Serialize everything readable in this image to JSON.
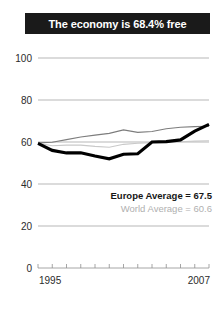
{
  "title": "The economy is 68.4% free",
  "chart_data": {
    "type": "line",
    "title": "The economy is 68.4% free",
    "xlabel": "",
    "ylabel": "",
    "xlim": [
      1995,
      2007
    ],
    "ylim": [
      0,
      100
    ],
    "yticks": [
      0,
      20,
      40,
      60,
      80,
      100
    ],
    "xticks": [
      1995,
      1996,
      1997,
      1998,
      1999,
      2000,
      2001,
      2002,
      2003,
      2004,
      2005,
      2006,
      2007
    ],
    "xtick_labels_shown": [
      "1995",
      "2007"
    ],
    "grid": true,
    "legend_position": "inside-right",
    "x": [
      1995,
      1996,
      1997,
      1998,
      1999,
      2000,
      2001,
      2002,
      2003,
      2004,
      2005,
      2006,
      2007
    ],
    "series": [
      {
        "name": "Country",
        "color": "#000000",
        "width": "thick",
        "values": [
          59.3,
          56.0,
          54.8,
          54.9,
          53.3,
          52.0,
          54.2,
          54.4,
          60.0,
          60.2,
          61.0,
          65.2,
          68.4
        ]
      },
      {
        "name": "Europe Average",
        "color": "#7d7d7d",
        "width": "thin",
        "values": [
          59.6,
          59.9,
          61.1,
          62.4,
          63.3,
          64.1,
          65.8,
          64.6,
          65.0,
          66.3,
          67.0,
          67.3,
          67.5
        ]
      },
      {
        "name": "World Average",
        "color": "#c9c9c9",
        "width": "thin",
        "values": [
          59.4,
          58.2,
          58.5,
          58.5,
          57.9,
          57.5,
          58.9,
          59.4,
          59.7,
          59.9,
          60.1,
          60.4,
          60.6
        ]
      }
    ],
    "annotations": [
      {
        "label": "Europe Average = 67.5",
        "value": 67.5,
        "series": "Europe Average"
      },
      {
        "label": "World Average = 60.6",
        "value": 60.6,
        "series": "World Average"
      }
    ]
  },
  "axis": {
    "y_labels": [
      "100",
      "80",
      "60",
      "40",
      "20",
      "0"
    ],
    "x_label_start": "1995",
    "x_label_end": "2007"
  },
  "legend": {
    "europe": "Europe Average = 67.5",
    "world": "World Average = 60.6"
  },
  "colors": {
    "title_bar": "#1a1a1a",
    "title_text": "#ffffff",
    "country_line": "#000000",
    "europe_line": "#7d7d7d",
    "world_line": "#c9c9c9",
    "grid": "#9a9a9a",
    "background": "#ffffff"
  }
}
